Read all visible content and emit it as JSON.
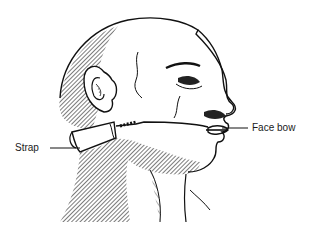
{
  "figure": {
    "labels": [
      {
        "id": "strap",
        "text": "Strap"
      },
      {
        "id": "face-bow",
        "text": "Face bow"
      }
    ]
  }
}
